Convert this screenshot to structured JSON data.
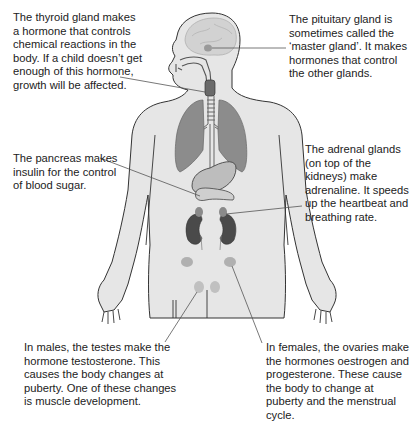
{
  "diagram": {
    "type": "labelled anatomical diagram",
    "colors": {
      "body_fill": "#e6e6e6",
      "outline": "#333333",
      "organ_gray": "#8a8a8a",
      "organ_dark": "#4a4a4a",
      "gland_fill": "#b4b4b4",
      "leader_line": "#555555",
      "text": "#222222"
    },
    "labels": {
      "thyroid": "The thyroid gland makes a hormone that controls chemical reactions in the body. If a child doesn’t get enough of this hormone, growth will be affected.",
      "pituitary": "The pituitary gland is sometimes called the ‘master gland’. It makes hormones that control the other glands.",
      "pancreas": "The pancreas makes insulin for the control of blood sugar.",
      "adrenal": "The adrenal glands (on top of the kidneys) make adrenaline. It speeds up the heartbeat and breathing rate.",
      "testes": "In males, the testes make the hormone testosterone. This causes the body changes at puberty. One of these changes is muscle development.",
      "ovaries": "In females, the ovaries make the hormones oestrogen and progesterone. These cause the body to change at puberty and the menstrual cycle."
    }
  }
}
